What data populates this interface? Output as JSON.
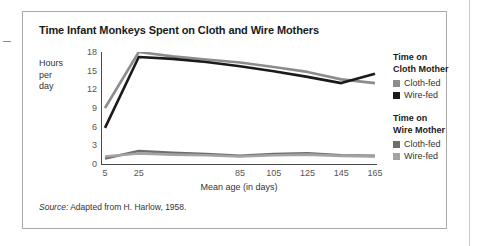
{
  "figure": {
    "title": "Time Infant Monkeys Spent on Cloth and Wire Mothers",
    "source_word": "Source:",
    "source_text": " Adapted from H. Harlow, 1958."
  },
  "legend": {
    "groups": [
      {
        "heading_line1": "Time on",
        "heading_line2": "Cloth Mother",
        "entries": [
          {
            "label": "Cloth-fed",
            "color": "#8c8c8c"
          },
          {
            "label": "Wire-fed",
            "color": "#1a1a1a"
          }
        ]
      },
      {
        "heading_line1": "Time on",
        "heading_line2": "Wire Mother",
        "entries": [
          {
            "label": "Cloth-fed",
            "color": "#6e6e6e"
          },
          {
            "label": "Wire-fed",
            "color": "#a3a3a3"
          }
        ]
      }
    ]
  },
  "chart_data": {
    "type": "line",
    "title": "Time Infant Monkeys Spent on Cloth and Wire Mothers",
    "xlabel": "Mean age (in days)",
    "ylabel": "Hours per day",
    "ylabel_lines": [
      "Hours",
      "per",
      "day"
    ],
    "x": [
      5,
      25,
      45,
      65,
      85,
      105,
      125,
      145,
      165
    ],
    "xtick_labels": [
      "5",
      "25",
      "",
      "",
      "85",
      "105",
      "125",
      "145",
      "165"
    ],
    "ylim": [
      0,
      18
    ],
    "yticks": [
      0,
      3,
      6,
      9,
      12,
      15,
      18
    ],
    "ytick_labels": [
      "0",
      "3",
      "6",
      "9",
      "12",
      "15",
      "18"
    ],
    "grid": false,
    "legend_position": "right",
    "series": [
      {
        "name": "Time on Cloth Mother - Cloth-fed",
        "color": "#8c8c8c",
        "values": [
          9.0,
          18.0,
          17.3,
          16.8,
          16.3,
          15.6,
          14.8,
          13.6,
          13.0
        ]
      },
      {
        "name": "Time on Cloth Mother - Wire-fed",
        "color": "#1a1a1a",
        "values": [
          5.8,
          17.2,
          16.9,
          16.4,
          15.7,
          14.9,
          14.0,
          13.0,
          14.5
        ]
      },
      {
        "name": "Time on Wire Mother - Cloth-fed",
        "color": "#6e6e6e",
        "values": [
          0.9,
          2.1,
          1.8,
          1.6,
          1.3,
          1.6,
          1.7,
          1.4,
          1.3
        ]
      },
      {
        "name": "Time on Wire Mother - Wire-fed",
        "color": "#a3a3a3",
        "values": [
          1.2,
          1.7,
          1.5,
          1.4,
          1.2,
          1.4,
          1.5,
          1.3,
          1.2
        ]
      }
    ]
  }
}
